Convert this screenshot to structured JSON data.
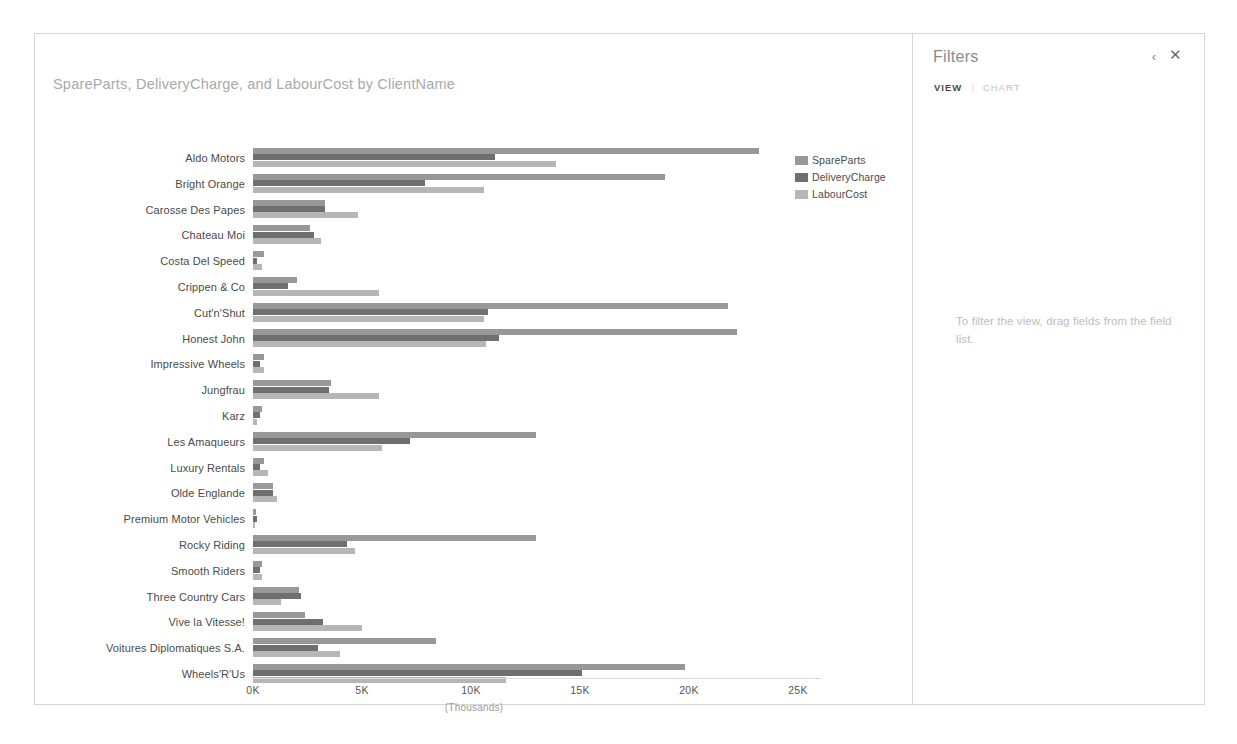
{
  "chart_panel": {
    "title": "SpareParts, DeliveryCharge, and LabourCost by ClientName",
    "axis_caption": "(Thousands)"
  },
  "filters": {
    "title": "Filters",
    "collapse_icon": "chevron-left-icon",
    "close_icon": "close-icon",
    "tabs": [
      {
        "label": "VIEW",
        "active": true
      },
      {
        "label": "CHART",
        "active": false
      }
    ],
    "separator": "|",
    "hint": "To filter the view, drag fields from the field list."
  },
  "legend": {
    "position": "right",
    "items": [
      {
        "label": "SpareParts",
        "color": "#989898"
      },
      {
        "label": "DeliveryCharge",
        "color": "#6f6f6f"
      },
      {
        "label": "LabourCost",
        "color": "#b6b6b6"
      }
    ]
  },
  "chart_data": {
    "type": "bar",
    "orientation": "horizontal",
    "title": "SpareParts, DeliveryCharge, and LabourCost by ClientName",
    "xlabel": "(Thousands)",
    "ylabel": "ClientName",
    "xlim": [
      0,
      26
    ],
    "xticks": [
      0,
      5,
      10,
      15,
      20,
      25
    ],
    "xticklabels": [
      "0K",
      "5K",
      "10K",
      "15K",
      "20K",
      "25K"
    ],
    "grid": false,
    "legend_position": "right",
    "units": "Thousands",
    "categories": [
      "Aldo Motors",
      "Bright Orange",
      "Carosse Des Papes",
      "Chateau Moi",
      "Costa Del Speed",
      "Crippen & Co",
      "Cut'n'Shut",
      "Honest John",
      "Impressive Wheels",
      "Jungfrau",
      "Karz",
      "Les Amaqueurs",
      "Luxury Rentals",
      "Olde Englande",
      "Premium Motor Vehicles",
      "Rocky Riding",
      "Smooth Riders",
      "Three Country Cars",
      "Vive la Vitesse!",
      "Voitures Diplomatiques S.A.",
      "Wheels'R'Us"
    ],
    "series": [
      {
        "name": "SpareParts",
        "color": "#989898",
        "values": [
          23.2,
          18.9,
          3.3,
          2.6,
          0.5,
          2.0,
          21.8,
          22.2,
          0.5,
          3.6,
          0.4,
          13.0,
          0.5,
          0.9,
          0.15,
          13.0,
          0.4,
          2.1,
          2.4,
          8.4,
          19.8
        ]
      },
      {
        "name": "DeliveryCharge",
        "color": "#6f6f6f",
        "values": [
          11.1,
          7.9,
          3.3,
          2.8,
          0.2,
          1.6,
          10.8,
          11.3,
          0.3,
          3.5,
          0.3,
          7.2,
          0.3,
          0.9,
          0.2,
          4.3,
          0.3,
          2.2,
          3.2,
          3.0,
          15.1
        ]
      },
      {
        "name": "LabourCost",
        "color": "#b6b6b6",
        "values": [
          13.9,
          10.6,
          4.8,
          3.1,
          0.4,
          5.8,
          10.6,
          10.7,
          0.5,
          5.8,
          0.2,
          5.9,
          0.7,
          1.1,
          0.1,
          4.7,
          0.4,
          1.3,
          5.0,
          4.0,
          11.6
        ]
      }
    ]
  }
}
